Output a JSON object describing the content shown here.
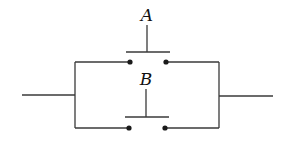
{
  "diagram": {
    "type": "parallel-switch-circuit",
    "colors": {
      "wire": "#3a3a3a",
      "contact": "#1a1a1a",
      "label": "#111111",
      "background": "#ffffff"
    },
    "switches": [
      {
        "id": "A",
        "label": "A",
        "branch": "top"
      },
      {
        "id": "B",
        "label": "B",
        "branch": "bottom"
      }
    ],
    "terminals": {
      "left": "input-line",
      "right": "output-line"
    }
  }
}
